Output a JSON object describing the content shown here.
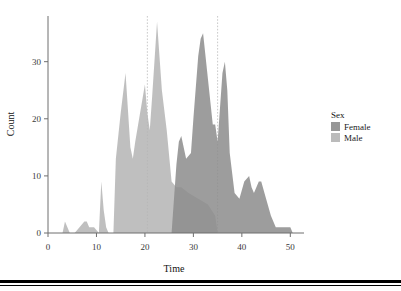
{
  "chart_data": {
    "type": "area",
    "title": "",
    "subtitle": "",
    "xlabel": "Time",
    "ylabel": "Count",
    "xlim": [
      0,
      52
    ],
    "ylim": [
      0,
      38
    ],
    "xticks": [
      0,
      10,
      20,
      30,
      40,
      50
    ],
    "yticks": [
      0,
      10,
      20,
      30
    ],
    "xtick_labels": [
      "0",
      "10",
      "20",
      "30",
      "40",
      "50"
    ],
    "ytick_labels": [
      "0",
      "10",
      "20",
      "30"
    ],
    "grid": false,
    "stacked": false,
    "overlap_mode": "identity-alpha",
    "legend": {
      "title": "Sex",
      "position": "right",
      "entries": [
        {
          "label": "Female",
          "color": "#8c8c8c"
        },
        {
          "label": "Male",
          "color": "#b4b4b4"
        }
      ]
    },
    "annotations": [
      {
        "kind": "vline",
        "x": 20.5,
        "style": "dotted",
        "color": "#c9c9c9"
      },
      {
        "kind": "vline",
        "x": 35.0,
        "style": "dotted",
        "color": "#c9c9c9"
      }
    ],
    "series": [
      {
        "name": "Male",
        "color": "#b4b4b4",
        "opacity": 0.85,
        "x": [
          3.0,
          3.5,
          4.5,
          5.5,
          6.5,
          7.5,
          8.0,
          8.5,
          9.5,
          10.5,
          11.0,
          11.5,
          12.0,
          12.5,
          13.5,
          14.0,
          15.0,
          16.0,
          17.0,
          17.5,
          18.0,
          19.0,
          20.0,
          20.5,
          21.0,
          21.5,
          22.5,
          23.5,
          24.5,
          25.5,
          26.5,
          27.5,
          29.0,
          31.0,
          33.0,
          34.5,
          35.0
        ],
        "y": [
          0,
          2,
          0,
          0,
          1,
          2,
          2,
          1,
          1,
          0,
          9,
          4,
          1,
          0,
          0,
          13,
          21,
          28,
          15,
          13,
          16,
          21,
          26,
          21,
          18,
          24,
          37,
          25,
          18,
          9,
          8,
          8,
          7,
          6,
          5,
          3,
          0
        ]
      },
      {
        "name": "Female",
        "color": "#8c8c8c",
        "opacity": 0.85,
        "x": [
          25.5,
          26.5,
          27.0,
          27.5,
          28.5,
          29.5,
          30.0,
          31.0,
          31.5,
          32.0,
          32.5,
          33.5,
          34.0,
          34.5,
          35.0,
          35.5,
          36.0,
          36.5,
          37.0,
          37.5,
          38.5,
          39.5,
          40.5,
          41.5,
          42.0,
          42.5,
          43.5,
          44.0,
          45.0,
          46.0,
          47.0,
          48.0,
          49.0,
          50.0,
          50.5
        ],
        "y": [
          0,
          12,
          16,
          17,
          13,
          14,
          20,
          31,
          34,
          35,
          31,
          23,
          19,
          19,
          16,
          22,
          28,
          30,
          25,
          14,
          7,
          6,
          9,
          10,
          8,
          7,
          9,
          9,
          6,
          3,
          1,
          1,
          1,
          1,
          0
        ]
      }
    ]
  }
}
